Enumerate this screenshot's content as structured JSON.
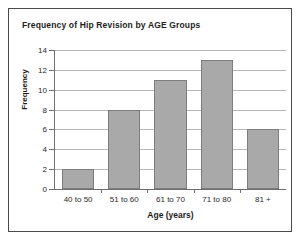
{
  "chart_data": {
    "type": "bar",
    "title": "Frequency of Hip Revision by AGE Groups",
    "xlabel": "Age (years)",
    "ylabel": "Frequency",
    "categories": [
      "40 to 50",
      "51 to 60",
      "61 to 70",
      "71 to 80",
      "81 +"
    ],
    "values": [
      2,
      8,
      11,
      13,
      6
    ],
    "ylim": [
      0,
      14
    ],
    "ytick_labels": [
      "0",
      "2",
      "4",
      "6",
      "8",
      "10",
      "12",
      "14"
    ],
    "ytick_values": [
      0,
      2,
      4,
      6,
      8,
      10,
      12,
      14
    ],
    "grid": "horizontal",
    "legend": "none",
    "bar_color": "#a9a9a9",
    "bar_border_color": "#7d7d7d",
    "gridline_color": "#b6b6b6",
    "axis_color": "#6e6e6e",
    "background_color": "#ffffff",
    "border_color": "#4a4a4a"
  }
}
